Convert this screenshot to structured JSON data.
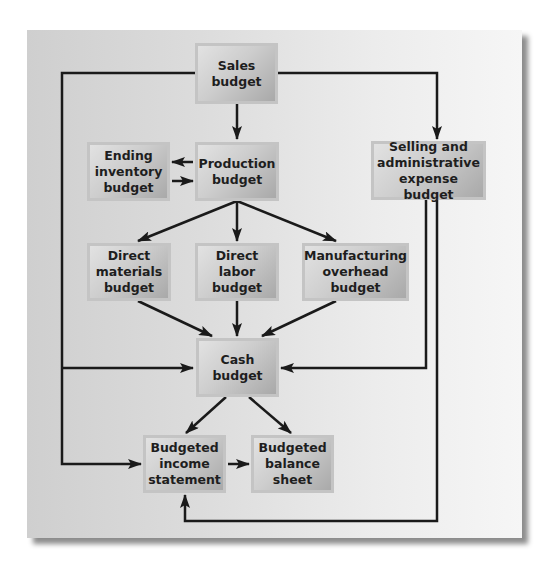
{
  "diagram": {
    "type": "flowchart",
    "nodes": [
      {
        "id": "sales",
        "label": "Sales\nbudget"
      },
      {
        "id": "ending_inventory",
        "label": "Ending\ninventory\nbudget"
      },
      {
        "id": "production",
        "label": "Production\nbudget"
      },
      {
        "id": "selling_admin",
        "label": "Selling and\nadministrative\nexpense budget"
      },
      {
        "id": "direct_materials",
        "label": "Direct\nmaterials\nbudget"
      },
      {
        "id": "direct_labor",
        "label": "Direct\nlabor\nbudget"
      },
      {
        "id": "manufacturing_overhead",
        "label": "Manufacturing\noverhead\nbudget"
      },
      {
        "id": "cash",
        "label": "Cash\nbudget"
      },
      {
        "id": "income_statement",
        "label": "Budgeted\nincome\nstatement"
      },
      {
        "id": "balance_sheet",
        "label": "Budgeted\nbalance\nsheet"
      }
    ],
    "edges": [
      {
        "from": "sales",
        "to": "production"
      },
      {
        "from": "sales",
        "to": "selling_admin"
      },
      {
        "from": "sales",
        "to": "cash"
      },
      {
        "from": "sales",
        "to": "income_statement"
      },
      {
        "from": "production",
        "to": "ending_inventory"
      },
      {
        "from": "ending_inventory",
        "to": "production"
      },
      {
        "from": "production",
        "to": "direct_materials"
      },
      {
        "from": "production",
        "to": "direct_labor"
      },
      {
        "from": "production",
        "to": "manufacturing_overhead"
      },
      {
        "from": "direct_materials",
        "to": "cash"
      },
      {
        "from": "direct_labor",
        "to": "cash"
      },
      {
        "from": "manufacturing_overhead",
        "to": "cash"
      },
      {
        "from": "selling_admin",
        "to": "cash"
      },
      {
        "from": "selling_admin",
        "to": "income_statement"
      },
      {
        "from": "cash",
        "to": "income_statement"
      },
      {
        "from": "cash",
        "to": "balance_sheet"
      },
      {
        "from": "income_statement",
        "to": "balance_sheet"
      }
    ]
  },
  "colors": {
    "arrow": "#1a1a1a",
    "box_light": "#e2e2e2",
    "box_dark": "#a9a9a9",
    "panel_left": "#cfcfcf",
    "panel_right": "#f6f6f6"
  }
}
